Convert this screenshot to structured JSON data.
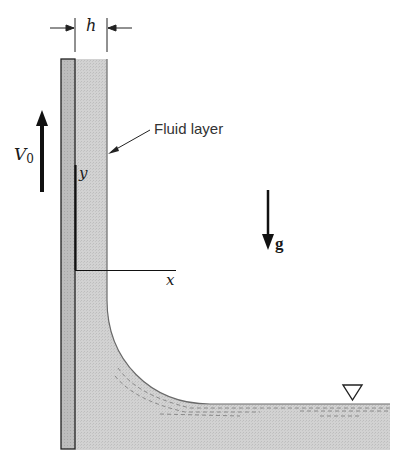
{
  "figure": {
    "labels": {
      "thickness": "h",
      "wall_velocity": "V",
      "wall_velocity_sub": "0",
      "fluid_layer": "Fluid layer",
      "gravity": "g",
      "y_axis": "y",
      "x_axis": "x"
    },
    "symbols": {
      "free_surface": "free-surface-triangle-icon"
    },
    "colors": {
      "wall_fill": "#b8b8b8",
      "fluid_fill": "#cfcfcf",
      "line": "#222222",
      "dash": "#8a8a8a"
    }
  }
}
